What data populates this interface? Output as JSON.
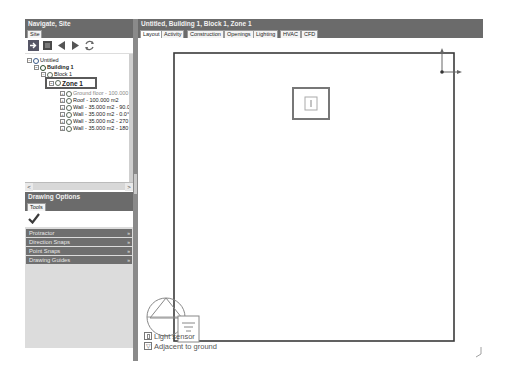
{
  "navigate_panel": {
    "title": "Navigate, Site",
    "tab": "Site",
    "toolbar": [
      "enter-icon",
      "block-icon",
      "back-arrow-icon",
      "forward-arrow-icon",
      "refresh-icon"
    ],
    "tree": [
      {
        "label": "Untitled",
        "level": 0,
        "expander": "−"
      },
      {
        "label": "Building 1",
        "level": 1,
        "expander": "−",
        "bold": true
      },
      {
        "label": "Block 1",
        "level": 2,
        "expander": "−"
      },
      {
        "label": "Zone 1",
        "level": 3,
        "expander": "−",
        "bold": true,
        "selected": true
      },
      {
        "label": "Ground floor - 100.000",
        "level": 4,
        "expander": "+"
      },
      {
        "label": "Roof - 100.000 m2",
        "level": 4,
        "expander": "+"
      },
      {
        "label": "Wall - 35.000 m2 - 90.0",
        "level": 4,
        "expander": "+"
      },
      {
        "label": "Wall - 35.000 m2 - 0.0°",
        "level": 4,
        "expander": "+"
      },
      {
        "label": "Wall - 35.000 m2 - 270",
        "level": 4,
        "expander": "+"
      },
      {
        "label": "Wall - 35.000 m2 - 180",
        "level": 4,
        "expander": "+"
      }
    ],
    "scroll_left": "<",
    "scroll_right": ">"
  },
  "drawing_options": {
    "title": "Drawing Options",
    "tab": "Tools",
    "confirm_icon": "checkmark-icon",
    "sections": [
      {
        "label": "Protractor",
        "chevron": "»"
      },
      {
        "label": "Direction Snaps",
        "chevron": "»"
      },
      {
        "label": "Point Snaps",
        "chevron": "»"
      },
      {
        "label": "Drawing Guides",
        "chevron": "»"
      }
    ]
  },
  "main": {
    "title": "Untitled, Building 1, Block 1, Zone 1",
    "tabs": [
      "Layout",
      "Activity",
      "Construction",
      "Openings",
      "Lighting",
      "HVAC",
      "CFD"
    ],
    "active_tab": "Layout",
    "legend": [
      {
        "icon": "light-sensor-icon",
        "label": "Light sensor"
      },
      {
        "icon": "adjacent-ground-icon",
        "label": "Adjacent to ground"
      }
    ]
  }
}
